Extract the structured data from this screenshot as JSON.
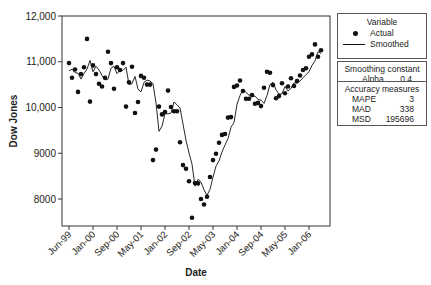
{
  "chart_data": {
    "type": "line",
    "title": "",
    "xlabel": "Date",
    "ylabel": "Dow Jones",
    "ylim": [
      7400,
      12050
    ],
    "yticks": [
      8000,
      9000,
      10000,
      11000,
      12000
    ],
    "ytick_labels": [
      "8000",
      "9000",
      "10,000",
      "11,000",
      "12,000"
    ],
    "xtick_labels": [
      "Jun-99",
      "Jan-00",
      "Sep-00",
      "May-01",
      "Jan-02",
      "Sep-02",
      "May-03",
      "Jan-04",
      "Sep-04",
      "May-05",
      "Jan-06"
    ],
    "grid": false,
    "legend_position": "right",
    "series": [
      {
        "name": "Actual",
        "style": "markers",
        "values": [
          10970,
          10650,
          10830,
          10340,
          10730,
          10880,
          11500,
          10130,
          10920,
          10730,
          10520,
          10460,
          10650,
          11220,
          10970,
          10410,
          10880,
          10820,
          10970,
          10020,
          10550,
          10890,
          9880,
          10120,
          10690,
          10650,
          10500,
          10500,
          8850,
          9080,
          10020,
          9850,
          9900,
          10370,
          10010,
          9920,
          9920,
          9240,
          8740,
          8660,
          8390,
          7590,
          8350,
          8340,
          8000,
          7880,
          8050,
          8480,
          8850,
          8990,
          9230,
          9400,
          9420,
          9780,
          9790,
          10450,
          10480,
          10590,
          10360,
          10190,
          10190,
          10270,
          10080,
          10100,
          10030,
          10430,
          10780,
          10760,
          10490,
          10200,
          10250,
          10530,
          10310,
          10460,
          10640,
          10470,
          10580,
          10700,
          10820,
          10860,
          11110,
          11160,
          11380,
          11110,
          11250
        ],
        "color": "#111111"
      },
      {
        "name": "Smoothed",
        "style": "line",
        "values": [
          10800,
          10840,
          10760,
          10750,
          10620,
          10740,
          10840,
          11030,
          10780,
          10900,
          10820,
          10700,
          10600,
          10620,
          10860,
          10900,
          10740,
          10810,
          10810,
          10880,
          10500,
          10520,
          10680,
          10400,
          10340,
          10550,
          10600,
          10580,
          10520,
          10100,
          9480,
          9590,
          9870,
          9860,
          9880,
          10120,
          10060,
          9990,
          9640,
          9280,
          9010,
          8760,
          8280,
          8430,
          8370,
          8200,
          8080,
          8210,
          8480,
          8720,
          8830,
          9030,
          9180,
          9320,
          9570,
          9670,
          10070,
          10260,
          10400,
          10330,
          10270,
          10240,
          10250,
          10180,
          10160,
          10090,
          10260,
          10500,
          10550,
          10390,
          10290,
          10300,
          10460,
          10360,
          10420,
          10540,
          10530,
          10580,
          10650,
          10720,
          10780,
          10920,
          11020,
          11220,
          11180
        ],
        "color": "#111111"
      }
    ],
    "legend": {
      "title": "Variable",
      "entries": [
        "Actual",
        "Smoothed"
      ]
    },
    "smoothing": {
      "title": "Smoothing constant",
      "label": "Alpha",
      "value": "0.4"
    },
    "accuracy": {
      "title": "Accuracy measures",
      "rows": [
        {
          "label": "MAPE",
          "value": "3"
        },
        {
          "label": "MAD",
          "value": "338"
        },
        {
          "label": "MSD",
          "value": "195696"
        }
      ]
    }
  }
}
